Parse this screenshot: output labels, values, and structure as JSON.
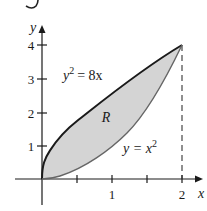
{
  "figure": {
    "top_fragment": "5",
    "axes": {
      "x_label": "x",
      "y_label": "y",
      "x_ticks": [
        {
          "value": 0.5,
          "label": ""
        },
        {
          "value": 1,
          "label": "1"
        },
        {
          "value": 1.5,
          "label": ""
        },
        {
          "value": 2,
          "label": "2"
        }
      ],
      "y_ticks": [
        {
          "value": 1,
          "label": "1"
        },
        {
          "value": 2,
          "label": "2"
        },
        {
          "value": 3,
          "label": "3"
        },
        {
          "value": 4,
          "label": "4"
        }
      ]
    },
    "curves": [
      {
        "name": "upper",
        "equation_lhs": "y",
        "equation_exp": "2",
        "equation_rhs": "= 8x",
        "full": "y^2 = 8x",
        "color": "#1a1a1a"
      },
      {
        "name": "lower",
        "equation_lhs": "y = x",
        "equation_exp": "2",
        "full": "y = x^2",
        "color": "#555555"
      }
    ],
    "region_label": "R",
    "region_fill": "#d4d4d4",
    "intersection": {
      "x": 2,
      "y": 4
    },
    "dashed_line": "x = 2"
  }
}
